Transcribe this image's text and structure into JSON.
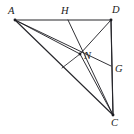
{
  "figure": {
    "kind": "plane-geometry-line-figure",
    "background_color": "#ffffff",
    "stroke_color": "#26262b",
    "label_color": "#1b1b20",
    "canvas": {
      "width": 134,
      "height": 134
    },
    "points": [
      {
        "id": "A",
        "label": "A",
        "x": 15,
        "y": 20,
        "label_x": 8,
        "label_y": 6,
        "dot": true
      },
      {
        "id": "H",
        "label": "H",
        "x": 68,
        "y": 20,
        "label_x": 61,
        "label_y": 6,
        "dot": false
      },
      {
        "id": "D",
        "label": "D",
        "x": 111,
        "y": 20,
        "label_x": 112,
        "label_y": 5,
        "dot": true
      },
      {
        "id": "N",
        "label": "N",
        "x": 80,
        "y": 54,
        "label_x": 84,
        "label_y": 51,
        "dot": true
      },
      {
        "id": "G",
        "label": "G",
        "x": 111,
        "y": 66,
        "label_x": 115,
        "label_y": 64,
        "dot": false
      },
      {
        "id": "C",
        "label": "C",
        "x": 113,
        "y": 115,
        "label_x": 111,
        "label_y": 118,
        "dot": true
      },
      {
        "id": "P",
        "label": "",
        "x": 62,
        "y": 68,
        "label_x": 0,
        "label_y": 0,
        "dot": false
      }
    ],
    "segments": [
      {
        "name": "side-AD",
        "from": "A",
        "to": "D",
        "weight": "w-main"
      },
      {
        "name": "side-DC",
        "from": "D",
        "to": "C",
        "weight": "w-main"
      },
      {
        "name": "side-AC",
        "from": "A",
        "to": "C",
        "weight": "w-main"
      },
      {
        "name": "cevian-A-to-G",
        "from": "A",
        "to": "G",
        "weight": "w-thin"
      },
      {
        "name": "cevian-H-to-C",
        "from": "H",
        "to": "C",
        "weight": "w-thin"
      },
      {
        "name": "cevian-D-to-C-through-N",
        "from": "D",
        "to": "C",
        "weight": "w-thin"
      },
      {
        "name": "cevian-D-to-N",
        "from": "D",
        "to": "N",
        "weight": "w-thin"
      },
      {
        "name": "cevian-N-to-C",
        "from": "N",
        "to": "C",
        "weight": "w-thin"
      },
      {
        "name": "segment-N-to-P",
        "from": "N",
        "to": "P",
        "weight": "w-hair"
      },
      {
        "name": "segment-A-to-N",
        "from": "A",
        "to": "N",
        "weight": "w-thin"
      }
    ]
  }
}
